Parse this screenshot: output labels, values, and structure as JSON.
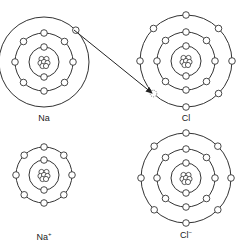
{
  "diagram": {
    "atoms": [
      {
        "id": "na",
        "label": "Na",
        "superscript": "",
        "center": [
          44,
          62
        ],
        "shells": [
          {
            "r": 15,
            "electrons": 2
          },
          {
            "r": 29,
            "electrons": 8
          },
          {
            "r": 45,
            "electrons": 1,
            "start_angle": -45
          }
        ]
      },
      {
        "id": "cl",
        "label": "Cl",
        "superscript": "",
        "center": [
          186,
          61
        ],
        "shells": [
          {
            "r": 15,
            "electrons": 2
          },
          {
            "r": 29,
            "electrons": 8
          },
          {
            "r": 46,
            "electrons": 7,
            "vacancy_angle": 135
          }
        ]
      },
      {
        "id": "na-ion",
        "label": "Na",
        "superscript": "+",
        "center": [
          44,
          175
        ],
        "shells": [
          {
            "r": 15,
            "electrons": 2
          },
          {
            "r": 28,
            "electrons": 8
          }
        ]
      },
      {
        "id": "cl-ion",
        "label": "Cl",
        "superscript": "−",
        "center": [
          186,
          178
        ],
        "shells": [
          {
            "r": 15,
            "electrons": 2
          },
          {
            "r": 29,
            "electrons": 8
          },
          {
            "r": 45,
            "electrons": 8
          }
        ]
      }
    ],
    "arrow": {
      "from": [
        74,
        30
      ],
      "to": [
        152,
        93
      ],
      "meaning": "electron transfer from Na to Cl"
    }
  },
  "labels": {
    "na": "Na",
    "cl": "Cl",
    "na_ion": "Na",
    "na_ion_sup": "+",
    "cl_ion": "Cl",
    "cl_ion_sup": "−"
  }
}
